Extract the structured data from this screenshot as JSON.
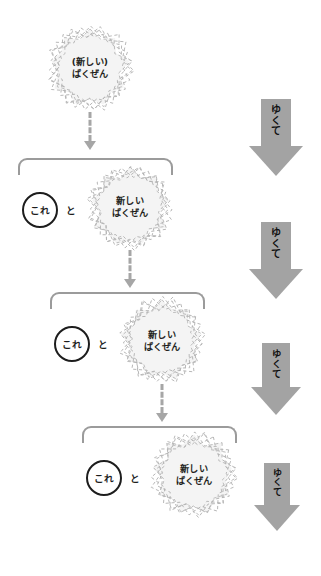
{
  "canvas": {
    "width": 321,
    "height": 576,
    "background": "#ffffff"
  },
  "colors": {
    "blob_fill": "#f4f4f4",
    "blob_outline": "#b3b3b3",
    "bracket": "#9b9b9b",
    "dashed_arrow": "#a6a6a6",
    "big_arrow": "#a3a3a3",
    "text": "#231f20",
    "circle_outline": "#1d1d1d"
  },
  "conjunction_label": "と",
  "circle_label": "これ",
  "stages": [
    {
      "id": "stage-1",
      "blob": {
        "lines": [
          "(新しい)",
          "ばくぜん"
        ],
        "x": 46,
        "y": 24,
        "size": 88,
        "font_size": 9.2
      },
      "has_circle": false,
      "has_bracket": false,
      "connector": {
        "x": 90,
        "y": 112,
        "height": 38
      }
    },
    {
      "id": "stage-2",
      "bracket": {
        "x": 18,
        "y": 158,
        "width": 155,
        "height": 17
      },
      "circle": {
        "x": 22,
        "y": 192,
        "size": 36,
        "font_size": 9.6
      },
      "conj": {
        "x": 66,
        "y": 203,
        "font_size": 9.6
      },
      "blob": {
        "lines": [
          "新しい",
          "ばくぜん"
        ],
        "x": 86,
        "y": 163,
        "size": 88,
        "font_size": 9.2
      },
      "connector": {
        "x": 130,
        "y": 250,
        "height": 38
      }
    },
    {
      "id": "stage-3",
      "bracket": {
        "x": 50,
        "y": 292,
        "width": 155,
        "height": 17
      },
      "circle": {
        "x": 54,
        "y": 326,
        "size": 36,
        "font_size": 9.6
      },
      "conj": {
        "x": 98,
        "y": 337,
        "font_size": 9.6
      },
      "blob": {
        "lines": [
          "新しい",
          "ばくぜん"
        ],
        "x": 118,
        "y": 297,
        "size": 88,
        "font_size": 9.2
      },
      "connector": {
        "x": 162,
        "y": 384,
        "height": 38
      }
    },
    {
      "id": "stage-4",
      "bracket": {
        "x": 82,
        "y": 426,
        "width": 155,
        "height": 17
      },
      "circle": {
        "x": 86,
        "y": 460,
        "size": 36,
        "font_size": 9.6
      },
      "conj": {
        "x": 130,
        "y": 471,
        "font_size": 9.6
      },
      "blob": {
        "lines": [
          "新しい",
          "ばくぜん"
        ],
        "x": 150,
        "y": 431,
        "size": 88,
        "font_size": 9.2
      },
      "connector": null
    }
  ],
  "big_arrows": [
    {
      "id": "yukute-1",
      "label_chars": [
        "ゆ",
        "く",
        "て"
      ],
      "x": 249,
      "y": 99,
      "shaft_w": 30,
      "shaft_h": 47,
      "head_w": 54,
      "head_h": 30,
      "font_size": 10
    },
    {
      "id": "yukute-2",
      "label_chars": [
        "ゆ",
        "く",
        "て"
      ],
      "x": 249,
      "y": 222,
      "shaft_w": 30,
      "shaft_h": 47,
      "head_w": 54,
      "head_h": 30,
      "font_size": 10
    },
    {
      "id": "yukute-3",
      "label_chars": [
        "ゆ",
        "く",
        "て"
      ],
      "x": 251,
      "y": 343,
      "shaft_w": 28,
      "shaft_h": 44,
      "head_w": 50,
      "head_h": 28,
      "font_size": 9.4
    },
    {
      "id": "yukute-4",
      "label_chars": [
        "ゆ",
        "く",
        "て"
      ],
      "x": 254,
      "y": 463,
      "shaft_w": 26,
      "shaft_h": 42,
      "head_w": 46,
      "head_h": 26,
      "font_size": 9
    }
  ]
}
